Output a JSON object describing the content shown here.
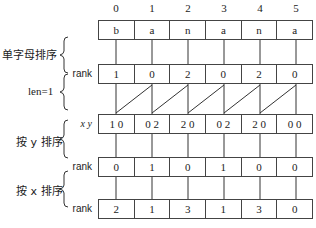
{
  "indices": [
    "0",
    "1",
    "2",
    "3",
    "4",
    "5"
  ],
  "rows": [
    {
      "label": "",
      "cells": [
        "b",
        "a",
        "n",
        "a",
        "n",
        "a"
      ]
    },
    {
      "label": "rank",
      "cells": [
        "1",
        "0",
        "2",
        "0",
        "2",
        "0"
      ]
    },
    {
      "label": "x y",
      "cells": [
        "1 0",
        "0 2",
        "2 0",
        "0 2",
        "2 0",
        "0 0"
      ]
    },
    {
      "label": "rank",
      "cells": [
        "0",
        "1",
        "0",
        "1",
        "0",
        "0"
      ]
    },
    {
      "label": "rank",
      "cells": [
        "2",
        "1",
        "3",
        "1",
        "3",
        "0"
      ]
    }
  ],
  "groups": [
    {
      "label": "单字母排序"
    },
    {
      "label": "len=1"
    },
    {
      "label": "按 y 排序"
    },
    {
      "label": "按 x 排序"
    }
  ]
}
